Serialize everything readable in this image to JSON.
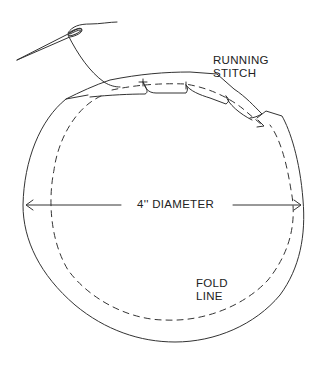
{
  "diagram": {
    "title": "",
    "labels": {
      "running_stitch": [
        "RUNNING",
        "STITCH"
      ],
      "diameter": "4'' DIAMETER",
      "fold_line": [
        "FOLD",
        "LINE"
      ]
    },
    "elements": [
      {
        "name": "needle",
        "description": "sewing needle with threaded eye, upper left"
      },
      {
        "name": "thread",
        "description": "thread running from needle eye down to gathered seam"
      },
      {
        "name": "fabric-circle",
        "description": "outer cut edge of circular fabric"
      },
      {
        "name": "fold-line",
        "description": "dashed line inset from edge indicating fold"
      },
      {
        "name": "gathered-hem",
        "description": "folded edge with running stitch along top"
      },
      {
        "name": "diameter-arrow",
        "description": "double-headed arrow across circle"
      }
    ],
    "colors": {
      "line": "#333333",
      "background": "#ffffff"
    }
  }
}
